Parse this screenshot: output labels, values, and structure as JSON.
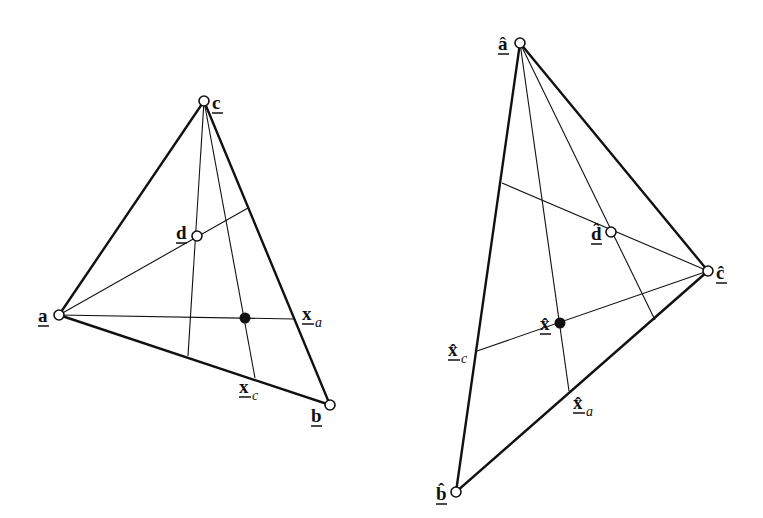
{
  "figure": {
    "left_triangle": {
      "vertices": {
        "a": {
          "label": "a",
          "x": 59,
          "y": 315
        },
        "b": {
          "label": "b",
          "x": 330,
          "y": 405
        },
        "c": {
          "label": "c",
          "x": 204,
          "y": 101
        }
      },
      "interior_points": {
        "d": {
          "label": "d",
          "x": 197,
          "y": 236,
          "style": "open"
        },
        "x": {
          "x": 245,
          "y": 318,
          "style": "filled"
        }
      },
      "edge_points": {
        "x_a": {
          "label": "x",
          "sub": "a",
          "x": 294,
          "y": 319
        },
        "x_c": {
          "label": "x",
          "sub": "c",
          "x": 255,
          "y": 378
        }
      },
      "rays": [
        {
          "from": [
            59,
            315
          ],
          "to": [
            294,
            319
          ]
        },
        {
          "from": [
            59,
            315
          ],
          "to": [
            248,
            208
          ]
        },
        {
          "from": [
            204,
            101
          ],
          "to": [
            188,
            356
          ]
        },
        {
          "from": [
            204,
            101
          ],
          "to": [
            255,
            378
          ]
        }
      ]
    },
    "right_triangle": {
      "vertices": {
        "a_hat": {
          "label": "â",
          "x": 520,
          "y": 43
        },
        "b_hat": {
          "label": "b̂",
          "x": 456,
          "y": 492
        },
        "c_hat": {
          "label": "ĉ",
          "x": 708,
          "y": 271
        }
      },
      "interior_points": {
        "d_hat": {
          "label": "d̂",
          "x": 611,
          "y": 232,
          "style": "open"
        },
        "x_hat": {
          "label": "x̂",
          "x": 560,
          "y": 323,
          "style": "filled"
        }
      },
      "edge_points": {
        "x_hat_a": {
          "label": "x̂",
          "sub": "a",
          "x": 569,
          "y": 391
        },
        "x_hat_c": {
          "label": "x̂",
          "sub": "c",
          "x": 477,
          "y": 351
        }
      },
      "rays": [
        {
          "from": [
            520,
            43
          ],
          "to": [
            569,
            391
          ]
        },
        {
          "from": [
            520,
            43
          ],
          "to": [
            655,
            320
          ]
        },
        {
          "from": [
            708,
            271
          ],
          "to": [
            502,
            183
          ]
        },
        {
          "from": [
            708,
            271
          ],
          "to": [
            477,
            351
          ]
        }
      ]
    }
  }
}
